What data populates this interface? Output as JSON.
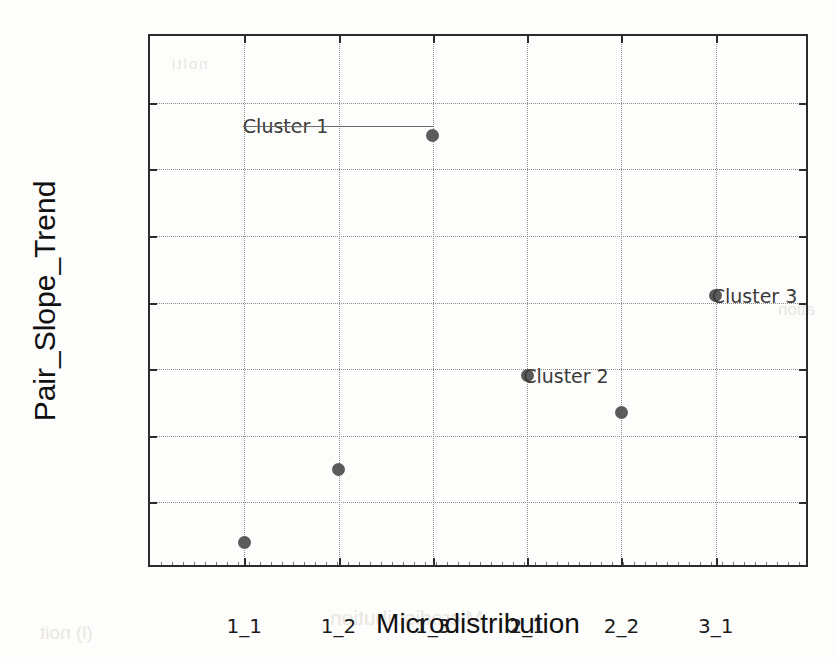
{
  "chart_data": {
    "type": "scatter",
    "title": "",
    "xlabel": "Microdistribution",
    "ylabel": "Pair_Slope_Trend",
    "categories": [
      "1_1",
      "1_2",
      "1_3",
      "2_1",
      "2_2",
      "3_1"
    ],
    "values": [
      0.0008,
      0.003,
      0.013,
      0.0058,
      0.0047,
      0.0082
    ],
    "ylim": [
      0,
      0.016
    ],
    "ytick_labels": [
      "0",
      "0.002",
      "0.004",
      "0.006",
      "0.008",
      "0.01",
      "0.012",
      "0.014",
      "0.016"
    ],
    "ytick_values": [
      0,
      0.002,
      0.004,
      0.006,
      0.008,
      0.01,
      0.012,
      0.014,
      0.016
    ],
    "grid": true,
    "legend": "none",
    "marker_color": "#5b5b5b",
    "axis_color": "#2b2b2b",
    "grid_color": "#8c8c8c",
    "annotations": [
      {
        "text": "Cluster 1",
        "category": "1_3",
        "value": 0.0133,
        "has_leader": true
      },
      {
        "text": "Cluster 2",
        "category": "2_1",
        "value": 0.0058,
        "has_leader": false
      },
      {
        "text": "Cluster 3",
        "category": "3_1",
        "value": 0.0082,
        "has_leader": false
      }
    ]
  },
  "background_bleed": {
    "line_a": "Microdistribution",
    "line_b": "(l) noit",
    "line_c": "ation",
    "line_d": "nolti"
  }
}
